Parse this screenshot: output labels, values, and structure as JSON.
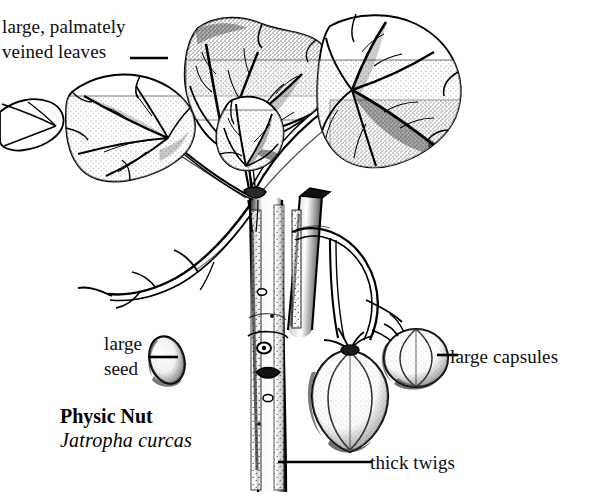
{
  "plate": {
    "common_name": "Physic Nut",
    "scientific_name": "Jatropha curcas",
    "background_color": "#ffffff",
    "ink_color": "#000000"
  },
  "labels": {
    "leaves": "large, palmately\nveined leaves",
    "seed": "large\nseed",
    "capsules": "large capsules",
    "twigs": "thick twigs"
  },
  "parts": {
    "leaf": "palmate-leaf",
    "seed": "seed-oval",
    "capsule": "fruit-capsule",
    "stem": "thick-stem",
    "petiole": "leaf-stalk"
  }
}
